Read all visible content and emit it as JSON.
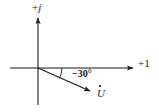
{
  "figure": {
    "background_color": "#ffffff",
    "stroke_color": "#1a1a1a",
    "width": 159,
    "height": 112
  },
  "axes": {
    "imaginary": {
      "label": "+j",
      "label_sign": "+",
      "label_symbol": "j",
      "name": "imaginary-axis",
      "direction": "up"
    },
    "real": {
      "label": "+1",
      "name": "real-axis",
      "direction": "right"
    },
    "origin": {
      "x": 38,
      "y": 68
    }
  },
  "phasor": {
    "label": "U",
    "notation": "U-with-dot",
    "angle_label": "−30°",
    "angle_degrees": -30,
    "tip": {
      "x": 93,
      "y": 93
    }
  },
  "arc": {
    "name": "angle-arc",
    "from_axis": "real",
    "to": "phasor"
  }
}
